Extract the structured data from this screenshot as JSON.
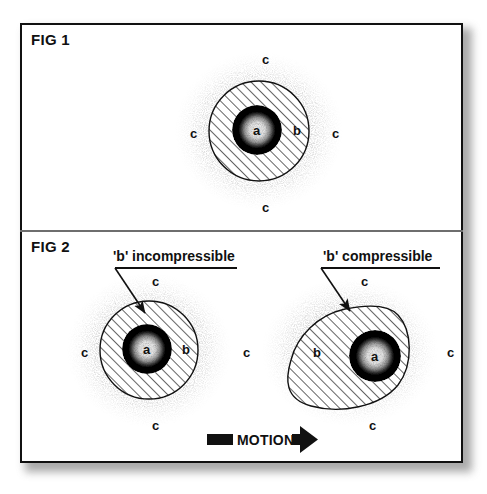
{
  "figure": {
    "panels": [
      {
        "id": "fig1",
        "label": "FIG 1",
        "shape_label_core": "a",
        "shape_label_shell": "b",
        "surround_labels": [
          "c",
          "c",
          "c",
          "c"
        ]
      },
      {
        "id": "fig2",
        "label": "FIG 2",
        "callouts": [
          {
            "id": "incompressible",
            "text": "'b' incompressible"
          },
          {
            "id": "compressible",
            "text": "'b' compressible"
          }
        ],
        "left_shape": {
          "core_label": "a",
          "shell_label": "b",
          "surround_labels": [
            "c",
            "c",
            "c"
          ]
        },
        "middle_label": "c",
        "right_shape": {
          "core_label": "a",
          "shell_label": "b",
          "surround_labels": [
            "c",
            "c",
            "c"
          ]
        },
        "motion": {
          "label": "MOTION",
          "direction": "right"
        }
      }
    ]
  },
  "colors": {
    "ink": "#111111",
    "frame": "#111111",
    "divider": "#6e6e6e",
    "paper": "#ffffff",
    "shadow": "#8e8e8e",
    "stipple": "#9a9a9a"
  }
}
